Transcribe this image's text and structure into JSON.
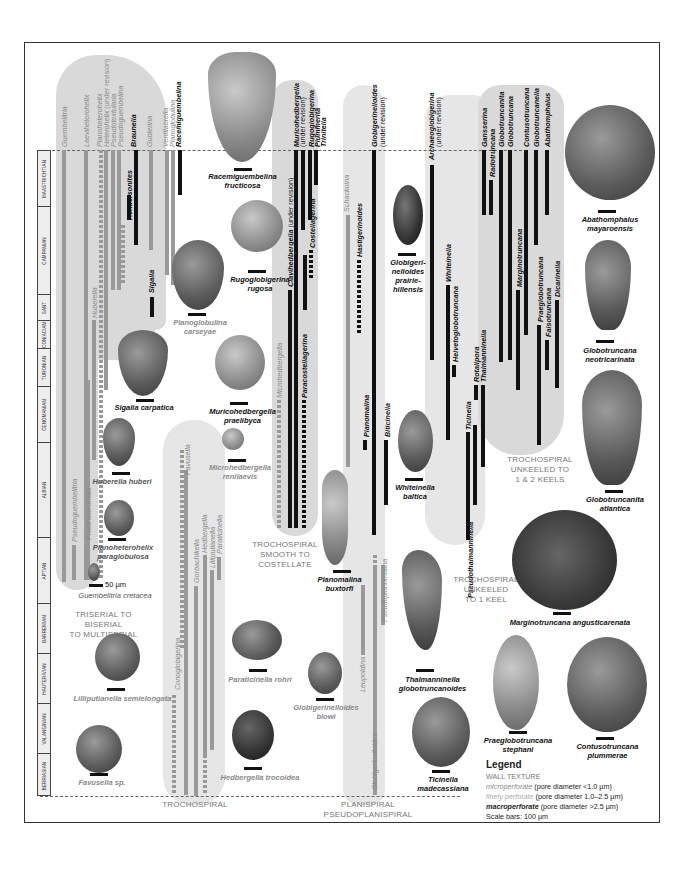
{
  "stages": [
    {
      "name": "MAASTRICHTIAN",
      "top": 0,
      "height": 56
    },
    {
      "name": "CAMPANIAN",
      "top": 56,
      "height": 88
    },
    {
      "name": "SANT",
      "top": 144,
      "height": 26
    },
    {
      "name": "CONIACIAN",
      "top": 170,
      "height": 28
    },
    {
      "name": "TURONIAN",
      "top": 198,
      "height": 38
    },
    {
      "name": "CENOMANIAN",
      "top": 236,
      "height": 56
    },
    {
      "name": "ALBIAN",
      "top": 292,
      "height": 95
    },
    {
      "name": "APTIAN",
      "top": 387,
      "height": 66
    },
    {
      "name": "BARREMIAN",
      "top": 453,
      "height": 50
    },
    {
      "name": "HAUTERIVIAN",
      "top": 503,
      "height": 50
    },
    {
      "name": "VALANGINIAN",
      "top": 553,
      "height": 50
    },
    {
      "name": "BERRIASIAN",
      "top": 603,
      "height": 43
    }
  ],
  "group_labels": {
    "triserial": "TRISERIAL TO BISERIAL\nTO MULTISERIAL",
    "trochospiral": "TROCHOSPIRAL",
    "smooth": "TROCHOSPIRAL\nSMOOTH TO COSTELLATE",
    "planispiral": "PLANISPIRAL\nPSEUDOPLANISPIRAL",
    "unkeeled1": "TROCHOSPIRAL\nUNKEELED\nTO 1 KEEL",
    "unkeeled2": "TROCHOSPIRAL\nUNKEELED TO\n1 & 2 KEELS"
  },
  "genera": {
    "guembelitria": "Guembelitria",
    "laeviheterohelix": "Laeviheterohelix",
    "planoheterohelix": "Planoheterohelix",
    "heterohelix": "Heterohelix",
    "heterohelix_note": "(under revision)",
    "pseudotextularia": "Pseudotextularia",
    "pseudoguembelina": "Pseudoguembelina",
    "braunella": "Braunella",
    "gublerina": "Gublerina",
    "ventilabrella": "Ventilabrella",
    "planoglobulina": "Planoglobulina",
    "racemiguembelina": "Racemiguembelina",
    "hendersonites": "Hendersonites",
    "sigalia": "Sigalia",
    "huberella": "Huberella",
    "protoheterohelix": "Protoheterohelix",
    "pseudoguembelitria": "Pseudoguembelitria",
    "favusella": "Favusella",
    "conoglobigerina": "Conoglobigerina",
    "gorbachikella": "Gorbachikella",
    "hedbergella": "Hedbergella",
    "lilliputianella": "Lilliputianella",
    "paraticinella": "Paraticinella",
    "microhedbergella": "Microhedbergella",
    "muricohedbergella": "Muricohedbergella",
    "muricohedbergella_note": "(under revision)",
    "rugoglobigerina": "Rugoglobigerina",
    "plummerita": "Plummerita",
    "trinitella": "Trinitella",
    "clavihedbergella": "Clavihedbergella",
    "clavihedbergella_note": "(under revision)",
    "costellagerina": "Costellagerina",
    "paracostellagerina": "Paracostellagerina",
    "schackoina": "Schackoina",
    "hastigerinoides": "Hastigerinoides",
    "globigerinelloides": "Globigerinelloides",
    "globigerinelloides_note": "(under revision)",
    "planomalina": "Planomalina",
    "biticinella": "Biticinella",
    "leupoldina": "Leupoldina",
    "pseudoplanomalina": "Pseudoplanomalina",
    "globigerinelloides_lower": "Globigerinelloides",
    "archaeoglobigerina": "Archaeoglobigerina",
    "archaeoglobigerina_note": "(under revision)",
    "whiteinella": "Whiteinella",
    "helvetoglobotruncana": "Helvetoglobotruncana",
    "rotalipora": "Rotalipora",
    "thalmanninella": "Thalmanninella",
    "ticinella": "Ticinella",
    "pseudothalmanninella": "Pseudothalmanninella",
    "gansserina": "Gansserina",
    "radotruncana": "Radotruncana",
    "globotruncanita": "Globotruncanita",
    "globotruncana": "Globotruncana",
    "marginotruncana": "Marginotruncana",
    "contusotruncana": "Contusotruncana",
    "globotruncanella": "Globotruncanella",
    "abathomphalus": "Abathomphalus",
    "praeglobotruncana": "Praeglobotruncana",
    "falsotruncana": "Falsotruncana",
    "dicarinella": "Dicarinella"
  },
  "specimens": {
    "racemiguembelina_fructicosa": "Racemiguembelina\nfructicosa",
    "rugoglobigerina_rugosa": "Rugoglobigerina\nrugosa",
    "planoglobulina_carseyae": "Planoglobulina\ncarseyae",
    "sigalia_carpatica": "Sigalia carpatica",
    "muricohedbergella_praelibyca": "Muricohedbergella\npraelibyca",
    "microhedbergella_renilaevis": "Microhedbergella\nrenilaevis",
    "huberella_huberi": "Huberella huberi",
    "planoheterohelix_paraglobulosa": "Planoheterohelix\nparaglobulosa",
    "guembelitria_cretacea": "Guembelitria cretacea",
    "scale_50": "50 µm",
    "lilliputianella_semielongata": "Lilliputianella semielongata",
    "favusella_sp": "Favusella sp.",
    "paraticinella_rohri": "Paraticinella rohri",
    "globigerinelloides_blowi": "Globigerinelloides\nblowi",
    "hedbergella_trocoidea": "Hedbergella trocoidea",
    "planomalina_buxtorfi": "Planomalina\nbuxtorfi",
    "globigerinelloides_prairiehillensis": "Globigeri-\nnelloides\nprairie-\nhillensis",
    "whiteinella_baltica": "Whiteinella\nbaltica",
    "thalmanninella_globotruncanoides": "Thalmanninella\nglobotruncanoides",
    "ticinella_madecassiana": "Ticinella\nmadecassiana",
    "abathomphalus_mayaroensis": "Abathomphalus\nmayaroensis",
    "globotruncana_neotricarinata": "Globotruncana\nneotricarinata",
    "globotruncanita_atlantica": "Globotruncanita\natlantica",
    "marginotruncana_angusticarenata": "Marginotruncana angusticarenata",
    "praeglobotruncana_stephani": "Praeglobotruncana\nstephani",
    "contusotruncana_plummerae": "Contusotruncana\nplummerae"
  },
  "legend": {
    "title": "Legend",
    "wall_texture": "WALL TEXTURE",
    "micro": "microperforate",
    "micro_desc": " (pore diameter <1.0 µm)",
    "finely": "finely perforate",
    "finely_desc": " (pore diameter 1.0–2.5 µm)",
    "macro": "macroperforate",
    "macro_desc": " (pore diameter >2.5 µm)",
    "scale": "Scale bars: 100  µm"
  }
}
